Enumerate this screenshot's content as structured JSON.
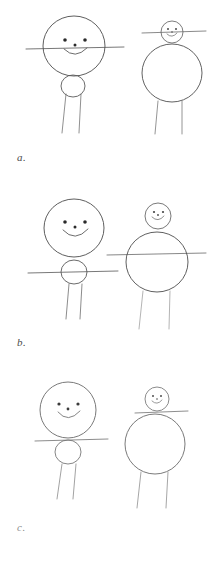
{
  "document": {
    "kind": "pencil-sketch-figure-sheet",
    "background_color": "#ffffff",
    "ink_color": "#555555",
    "faint_ink_color": "#9a9a9a",
    "width": 216,
    "height": 565
  },
  "panels": [
    {
      "id": "a",
      "label": "a.",
      "figures": [
        {
          "id": "a-left",
          "position": "left",
          "description": "large head circle with face on top of small body circle, arms at head center, two legs",
          "head": {
            "cx": 74,
            "cy": 46,
            "r": 31,
            "has_face": true
          },
          "body": {
            "cx": 73,
            "cy": 86,
            "r": 11
          },
          "arms": {
            "y": 48,
            "x1": 26,
            "x2": 124
          },
          "legs": [
            {
              "x1": 66,
              "y1": 94,
              "x2": 62,
              "y2": 132
            },
            {
              "x1": 81,
              "y1": 94,
              "x2": 79,
              "y2": 132
            }
          ],
          "face": {
            "eye_left": {
              "cx": 65,
              "cy": 40,
              "r": 1.7
            },
            "eye_right": {
              "cx": 85,
              "cy": 40,
              "r": 1.7
            },
            "nose": {
              "cx": 75,
              "cy": 45,
              "r": 1.4
            },
            "mouth": "smile"
          }
        },
        {
          "id": "a-right",
          "position": "right",
          "description": "small head circle with face on top of large body circle, arms at head level, two legs",
          "head": {
            "cx": 172,
            "cy": 32,
            "r": 11,
            "has_face": true
          },
          "body": {
            "cx": 172,
            "cy": 73,
            "r": 30
          },
          "arms": {
            "y": 32,
            "x1": 142,
            "x2": 205
          },
          "legs": [
            {
              "x1": 158,
              "y1": 101,
              "x2": 155,
              "y2": 133
            },
            {
              "x1": 182,
              "y1": 101,
              "x2": 182,
              "y2": 133
            }
          ],
          "face": {
            "eye_left": {
              "cx": 168,
              "cy": 29,
              "r": 1.0
            },
            "eye_right": {
              "cx": 176,
              "cy": 29,
              "r": 1.0
            },
            "nose": {
              "cx": 172,
              "cy": 32,
              "r": 0.8
            },
            "mouth": "smile"
          }
        }
      ]
    },
    {
      "id": "b",
      "label": "b.",
      "figures": [
        {
          "id": "b-left",
          "position": "left",
          "description": "large head circle with face, small body circle below, arms through body circle, two legs",
          "head": {
            "cx": 74,
            "cy": 228,
            "r": 30,
            "has_face": true
          },
          "body": {
            "cx": 74,
            "cy": 272,
            "r": 13
          },
          "arms": {
            "y": 272,
            "x1": 28,
            "x2": 118
          },
          "legs": [
            {
              "x1": 69,
              "y1": 284,
              "x2": 66,
              "y2": 318
            },
            {
              "x1": 82,
              "y1": 284,
              "x2": 80,
              "y2": 318
            }
          ],
          "face": {
            "eye_left": {
              "cx": 65,
              "cy": 222,
              "r": 1.7
            },
            "eye_right": {
              "cx": 85,
              "cy": 222,
              "r": 1.7
            },
            "nose": {
              "cx": 75,
              "cy": 227,
              "r": 1.4
            },
            "mouth": "smile"
          }
        },
        {
          "id": "b-right",
          "position": "right",
          "description": "small head circle with face on top of large body circle, arms at body mid-level, two faint legs",
          "head": {
            "cx": 158,
            "cy": 216,
            "r": 13,
            "has_face": true
          },
          "body": {
            "cx": 157,
            "cy": 262,
            "r": 31
          },
          "arms": {
            "y": 254,
            "x1": 107,
            "x2": 206
          },
          "legs": [
            {
              "x1": 143,
              "y1": 291,
              "x2": 139,
              "y2": 328
            },
            {
              "x1": 170,
              "y1": 291,
              "x2": 169,
              "y2": 328
            }
          ],
          "face": {
            "eye_left": {
              "cx": 154,
              "cy": 212,
              "r": 1.1
            },
            "eye_right": {
              "cx": 163,
              "cy": 212,
              "r": 1.1
            },
            "nose": {
              "cx": 158,
              "cy": 215,
              "r": 0.9
            },
            "mouth": "smile"
          }
        }
      ]
    },
    {
      "id": "c",
      "label": "c.",
      "figures": [
        {
          "id": "c-left",
          "position": "left",
          "description": "large head circle with face, arms at base of head, small body circle below, two legs",
          "head": {
            "cx": 68,
            "cy": 410,
            "r": 28,
            "has_face": true
          },
          "body": {
            "cx": 68,
            "cy": 452,
            "r": 13
          },
          "arms": {
            "y": 440,
            "x1": 35,
            "x2": 108
          },
          "legs": [
            {
              "x1": 62,
              "y1": 464,
              "x2": 57,
              "y2": 498
            },
            {
              "x1": 76,
              "y1": 464,
              "x2": 73,
              "y2": 498
            }
          ],
          "face": {
            "eye_left": {
              "cx": 59,
              "cy": 404,
              "r": 1.5
            },
            "eye_right": {
              "cx": 78,
              "cy": 404,
              "r": 1.5
            },
            "nose": {
              "cx": 68,
              "cy": 409,
              "r": 1.3
            },
            "mouth": "smile"
          }
        },
        {
          "id": "c-right",
          "position": "right",
          "description": "small head circle with face, arms at neck, large body circle, two legs",
          "head": {
            "cx": 157,
            "cy": 399,
            "r": 12,
            "has_face": true
          },
          "body": {
            "cx": 155,
            "cy": 444,
            "r": 30
          },
          "arms": {
            "y": 412,
            "x1": 135,
            "x2": 187
          },
          "legs": [
            {
              "x1": 141,
              "y1": 472,
              "x2": 137,
              "y2": 507
            },
            {
              "x1": 168,
              "y1": 472,
              "x2": 166,
              "y2": 507
            }
          ],
          "face": {
            "eye_left": {
              "cx": 153,
              "cy": 396,
              "r": 1.0
            },
            "eye_right": {
              "cx": 161,
              "cy": 396,
              "r": 1.0
            },
            "nose": {
              "cx": 157,
              "cy": 399,
              "r": 0.8
            },
            "mouth": "smile"
          }
        }
      ]
    }
  ]
}
